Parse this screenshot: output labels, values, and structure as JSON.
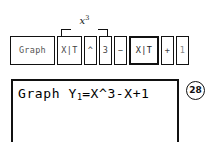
{
  "annotation": {
    "base": "x",
    "exponent": "3",
    "full_label": "x³",
    "bracket": "spans-keys-xt-caret-3"
  },
  "keystrokes": {
    "keys": [
      {
        "label": "Graph",
        "name": "graph-key"
      },
      {
        "label": "X|T",
        "name": "x-t-key"
      },
      {
        "label": "^",
        "name": "caret-key"
      },
      {
        "label": "3",
        "name": "three-key"
      },
      {
        "label": "−",
        "name": "minus-key"
      },
      {
        "label": "X|T",
        "name": "x-t-key-2"
      },
      {
        "label": "+",
        "name": "plus-key"
      },
      {
        "label": "1",
        "name": "one-key"
      }
    ]
  },
  "screen": {
    "line1_prefix": "Graph Y",
    "line1_subscript": "1",
    "line1_suffix": "=X^3-X+1",
    "line1_full": "Graph Y1=X^3-X+1"
  },
  "figure": {
    "number": "28"
  },
  "colors": {
    "ink": "#111111",
    "background": "#ffffff",
    "dim_ink": "#555555"
  }
}
